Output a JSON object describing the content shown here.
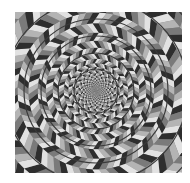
{
  "image": {
    "subject": "Fraser spiral illusion",
    "frame": {
      "x": 15,
      "y": 12,
      "width": 167,
      "height": 161
    },
    "center": {
      "x": 81,
      "y": 79
    },
    "palette": {
      "background": "#ffffff",
      "dark": "#2e2e2e",
      "mid": "#7a7a7a",
      "light": "#b4b4b4",
      "white": "#e2e2e2",
      "ring_stroke": "#3a3a3a"
    },
    "rings": [
      22,
      38,
      55,
      72,
      92,
      115
    ],
    "spokes": 36
  }
}
